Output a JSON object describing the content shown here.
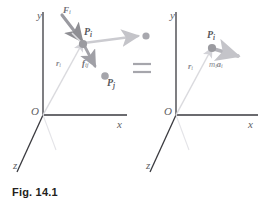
{
  "figure": {
    "caption": "Fig. 14.1",
    "relation_symbol": "=",
    "panels": [
      {
        "id": "left-panel",
        "name": "actual-forces-panel",
        "axes": {
          "origin_label": "O",
          "x_label": "x",
          "y_label": "y",
          "z_label": "z"
        },
        "points": [
          {
            "name": "particle-Pi",
            "label": "P",
            "subscript": "i"
          },
          {
            "name": "particle-Pj",
            "label": "P",
            "subscript": "j"
          }
        ],
        "vectors": [
          {
            "name": "applied-force-Fi",
            "label": "F",
            "subscript": "i"
          },
          {
            "name": "internal-force-fij",
            "label": "f",
            "subscript": "ij"
          },
          {
            "name": "position-vector-ri",
            "label": "r",
            "subscript": "i"
          }
        ]
      },
      {
        "id": "right-panel",
        "name": "effective-force-panel",
        "axes": {
          "origin_label": "O",
          "x_label": "x",
          "y_label": "y",
          "z_label": "z"
        },
        "points": [
          {
            "name": "particle-Pi",
            "label": "P",
            "subscript": "i"
          }
        ],
        "vectors": [
          {
            "name": "effective-force-miai",
            "label": "m",
            "subscript": "i",
            "label2": "a",
            "subscript2": "i"
          },
          {
            "name": "position-vector-ri",
            "label": "r",
            "subscript": "i"
          }
        ]
      }
    ]
  },
  "colors": {
    "axis": "#3a3a3f",
    "vector_dark": "#8e8e93",
    "vector_light": "#c9c9ce",
    "particle": "#9b9ba0",
    "caption_text": "#231f20",
    "background": "#ffffff"
  }
}
